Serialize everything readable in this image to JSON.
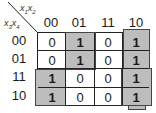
{
  "kmap": {
    "title_top_var": "x1x2",
    "title_left_var": "x3x4",
    "top_vars": [
      "x",
      "1",
      "x",
      "2"
    ],
    "left_vars": [
      "x",
      "3",
      "x",
      "4"
    ],
    "columns": [
      "00",
      "01",
      "11",
      "10"
    ],
    "rows": [
      "00",
      "01",
      "11",
      "10"
    ],
    "cells": [
      [
        "0",
        "1",
        "0",
        "1"
      ],
      [
        "0",
        "1",
        "0",
        "1"
      ],
      [
        "1",
        "0",
        "0",
        "1"
      ],
      [
        "1",
        "0",
        "0",
        "1"
      ]
    ],
    "groups": [
      {
        "name": "column-01-rows-00-01",
        "color": "#bdbdbd"
      },
      {
        "name": "column-10-rows-00-01",
        "color": "#bdbdbd"
      },
      {
        "name": "column-00-rows-11-10",
        "color": "#bdbdbd"
      },
      {
        "name": "column-10-rows-11-10",
        "color": "#bdbdbd"
      }
    ]
  }
}
